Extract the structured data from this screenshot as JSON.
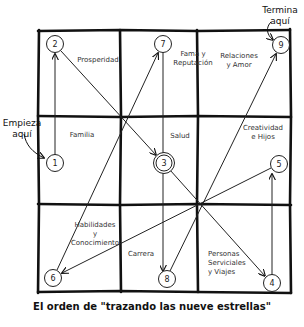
{
  "notes": {
    "start": "Empieza aquí",
    "start_line1": "Empieza",
    "start_line2": "aquí",
    "end_line1": "Termina",
    "end_line2": "aquí"
  },
  "cells": [
    {
      "id": "prosperidad",
      "line1": "Prosperidad",
      "line2": "",
      "line3": ""
    },
    {
      "id": "fama",
      "line1": "Fama y",
      "line2": "Reputación",
      "line3": ""
    },
    {
      "id": "relaciones",
      "line1": "Relaciones",
      "line2": "y Amor",
      "line3": ""
    },
    {
      "id": "familia",
      "line1": "Familia",
      "line2": "",
      "line3": ""
    },
    {
      "id": "salud",
      "line1": "Salud",
      "line2": "",
      "line3": ""
    },
    {
      "id": "creatividad",
      "line1": "Creatividad",
      "line2": "e Hijos",
      "line3": ""
    },
    {
      "id": "habilidades",
      "line1": "Habilidades",
      "line2": "y",
      "line3": "Conocimiento"
    },
    {
      "id": "carrera",
      "line1": "Carrera",
      "line2": "",
      "line3": ""
    },
    {
      "id": "personas",
      "line1": "Personas",
      "line2": "Serviciales",
      "line3": "y Viajes"
    }
  ],
  "stars": [
    {
      "n": "1",
      "x": 55,
      "y": 163
    },
    {
      "n": "2",
      "x": 55,
      "y": 44
    },
    {
      "n": "3",
      "x": 164,
      "y": 163
    },
    {
      "n": "4",
      "x": 272,
      "y": 283
    },
    {
      "n": "5",
      "x": 279,
      "y": 164
    },
    {
      "n": "6",
      "x": 53,
      "y": 278
    },
    {
      "n": "7",
      "x": 163,
      "y": 44
    },
    {
      "n": "8",
      "x": 167,
      "y": 279
    },
    {
      "n": "9",
      "x": 281,
      "y": 45
    }
  ],
  "path_order": [
    "1",
    "2",
    "3",
    "4",
    "5",
    "6",
    "7",
    "8",
    "9"
  ],
  "caption": "El orden de \"trazando las nueve estrellas\""
}
